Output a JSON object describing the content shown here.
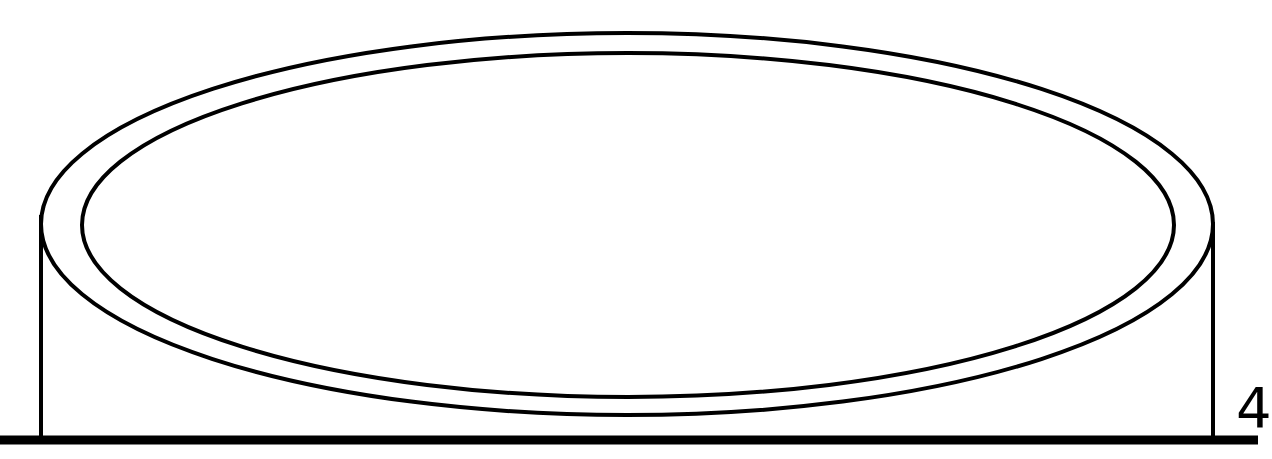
{
  "figure": {
    "stroke_color": "#000000",
    "background": "#ffffff",
    "outer_ellipse": {
      "cx": 627,
      "cy": 224,
      "rx": 586,
      "ry": 191
    },
    "inner_ellipse": {
      "cx": 628,
      "cy": 225,
      "rx": 546,
      "ry": 172
    },
    "left_wall": {
      "x": 41,
      "y1": 215,
      "y2": 440
    },
    "right_wall": {
      "x": 1213,
      "y1": 222,
      "y2": 440
    },
    "base_line": {
      "y": 440,
      "x1": 0,
      "x2": 1258
    },
    "reference_label": "4"
  }
}
